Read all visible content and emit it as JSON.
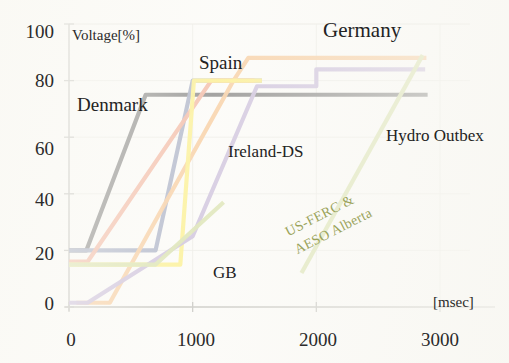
{
  "chart_data": {
    "type": "line",
    "title": "",
    "xlabel": "[msec]",
    "ylabel": "Voltage[%]",
    "xlim": [
      0,
      3200
    ],
    "ylim": [
      0,
      100
    ],
    "xticks": [
      0,
      1000,
      2000,
      3000
    ],
    "xtick_labels": [
      "0",
      "1000",
      "2000",
      "3000"
    ],
    "yticks": [
      0,
      20,
      40,
      60,
      80,
      100
    ],
    "ytick_labels": [
      "0",
      "20",
      "40",
      "60",
      "80",
      "100"
    ],
    "grid": true,
    "legend": "inline-annotations",
    "series": [
      {
        "name": "Denmark",
        "color": "#161616",
        "points": [
          [
            0,
            20
          ],
          [
            140,
            20
          ],
          [
            620,
            75
          ],
          [
            2900,
            75
          ]
        ]
      },
      {
        "name": "Spain",
        "color": "#5c6a96",
        "points": [
          [
            0,
            20
          ],
          [
            700,
            20
          ],
          [
            1000,
            80
          ],
          [
            1560,
            80
          ]
        ]
      },
      {
        "name": "Ireland-DS",
        "color": "#ea7a52",
        "points": [
          [
            0,
            16
          ],
          [
            150,
            16
          ],
          [
            1150,
            80
          ],
          [
            1500,
            80
          ]
        ]
      },
      {
        "name": "Germany",
        "color": "#f2a04a",
        "points": [
          [
            60,
            1.5
          ],
          [
            330,
            1.5
          ],
          [
            1330,
            80
          ],
          [
            1450,
            88
          ],
          [
            2890,
            88
          ]
        ]
      },
      {
        "name": "Yellow-grid-code",
        "color": "#fbe52c",
        "points": [
          [
            0,
            15
          ],
          [
            900,
            15
          ],
          [
            1010,
            80
          ],
          [
            1560,
            80
          ]
        ]
      },
      {
        "name": "GB",
        "color": "#9d86c0",
        "points": [
          [
            0,
            1.5
          ],
          [
            150,
            1.5
          ],
          [
            1000,
            25
          ],
          [
            1520,
            78
          ],
          [
            2000,
            78
          ],
          [
            2000,
            84
          ],
          [
            2880,
            84
          ]
        ]
      },
      {
        "name": "US-FERC & AESO Alberta",
        "color": "#b9cb6a",
        "points": [
          [
            0,
            15
          ],
          [
            700,
            15
          ],
          [
            1250,
            37
          ]
        ]
      },
      {
        "name": "US-FERC & AESO Alberta (ramp)",
        "color": "#b9cb6a",
        "points": [
          [
            1880,
            12
          ],
          [
            2860,
            89
          ]
        ]
      }
    ],
    "annotations": [
      {
        "text": "Voltage[%]",
        "x": 88,
        "y": 28,
        "role": "y-axis-unit"
      },
      {
        "text": "[msec]",
        "x": 433,
        "y": 296,
        "role": "x-axis-unit"
      },
      {
        "text": "Denmark",
        "x": 78,
        "y": 96,
        "role": "series-label"
      },
      {
        "text": "Spain",
        "x": 199,
        "y": 54,
        "role": "series-label"
      },
      {
        "text": "Germany",
        "x": 324,
        "y": 20,
        "role": "series-label"
      },
      {
        "text": "Ireland-DS",
        "x": 228,
        "y": 143,
        "role": "series-label"
      },
      {
        "text": "GB",
        "x": 213,
        "y": 265,
        "role": "series-label"
      },
      {
        "text": "Hydro Outbex",
        "x": 387,
        "y": 128,
        "role": "series-label"
      },
      {
        "text": "US-FERC &",
        "x": 283,
        "y": 222,
        "role": "rotated-label"
      },
      {
        "text": "AESO Alberta",
        "x": 283,
        "y": 238,
        "role": "rotated-label"
      }
    ]
  },
  "axis": {
    "y_unit": "Voltage[%]",
    "x_unit": "[msec]",
    "y_ticks": [
      "100",
      "80",
      "60",
      "40",
      "20",
      "0"
    ],
    "x_ticks": [
      "0",
      "1000",
      "2000",
      "3000"
    ]
  },
  "labels": {
    "denmark": "Denmark",
    "spain": "Spain",
    "germany": "Germany",
    "ireland": "Ireland-DS",
    "gb": "GB",
    "hydro": "Hydro Outbex",
    "usferc_line1": "US-FERC &",
    "usferc_line2": "AESO Alberta"
  },
  "colors": {
    "denmark": "#161616",
    "spain": "#5c6a96",
    "ireland": "#ea7a52",
    "germany": "#f2a04a",
    "yellow": "#fbe52c",
    "gb": "#9d86c0",
    "usferc": "#b9cb6a",
    "grid": "#dcdcd4",
    "axis": "#8c8c86",
    "text": "#2b2b2b"
  }
}
